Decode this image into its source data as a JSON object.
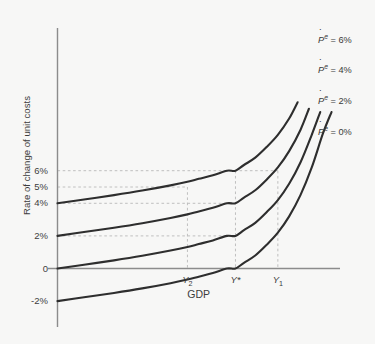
{
  "chart_data": {
    "type": "line",
    "title": "",
    "xlabel": "GDP",
    "ylabel": "Rate of change of unit costs",
    "grid": true,
    "legend_position": "right-of-curve-ends",
    "background_color": "#f7f7f6",
    "curve_color": "#2e2e2e",
    "axis_color": "#8c8c8c",
    "gridline_color": "#b9b9b9",
    "ylim": [
      -2,
      8
    ],
    "ytick_labels": [
      "6%",
      "5%",
      "4%",
      "2%",
      "0",
      "-2%"
    ],
    "ytick_values": [
      6,
      5,
      4,
      2,
      0,
      -2
    ],
    "xtick_labels": [
      "Y2",
      "Y*",
      "Y1"
    ],
    "xtick_display": [
      "Y",
      "Y*",
      "Y"
    ],
    "xtick_subscripts": [
      "2",
      "",
      "1"
    ],
    "xtick_values": [
      0.46,
      0.63,
      0.78
    ],
    "series": [
      {
        "name": "Pe = 6%",
        "label_p": "P",
        "label_sup": "e",
        "label_eq": " = 6%",
        "intercept": 4,
        "points": [
          [
            0.0,
            4.0
          ],
          [
            0.1,
            4.25
          ],
          [
            0.2,
            4.5
          ],
          [
            0.3,
            4.78
          ],
          [
            0.4,
            5.1
          ],
          [
            0.46,
            5.32
          ],
          [
            0.5,
            5.5
          ],
          [
            0.55,
            5.72
          ],
          [
            0.6,
            6.0
          ],
          [
            0.63,
            6.0
          ],
          [
            0.66,
            6.35
          ],
          [
            0.7,
            6.8
          ],
          [
            0.74,
            7.45
          ],
          [
            0.78,
            8.2
          ],
          [
            0.82,
            9.2
          ],
          [
            0.85,
            10.2
          ]
        ]
      },
      {
        "name": "Pe = 4%",
        "label_p": "P",
        "label_sup": "e",
        "label_eq": " = 4%",
        "intercept": 2,
        "points": [
          [
            0.0,
            2.0
          ],
          [
            0.1,
            2.25
          ],
          [
            0.2,
            2.5
          ],
          [
            0.3,
            2.78
          ],
          [
            0.4,
            3.1
          ],
          [
            0.46,
            3.32
          ],
          [
            0.5,
            3.5
          ],
          [
            0.55,
            3.72
          ],
          [
            0.6,
            4.0
          ],
          [
            0.63,
            4.0
          ],
          [
            0.66,
            4.35
          ],
          [
            0.7,
            4.8
          ],
          [
            0.74,
            5.45
          ],
          [
            0.78,
            6.2
          ],
          [
            0.82,
            7.2
          ],
          [
            0.86,
            8.5
          ],
          [
            0.89,
            9.8
          ]
        ]
      },
      {
        "name": "Pe = 2%",
        "label_p": "P",
        "label_sup": "e",
        "label_eq": " = 2%",
        "intercept": 0,
        "points": [
          [
            0.0,
            0.0
          ],
          [
            0.1,
            0.25
          ],
          [
            0.2,
            0.5
          ],
          [
            0.3,
            0.78
          ],
          [
            0.4,
            1.1
          ],
          [
            0.46,
            1.32
          ],
          [
            0.5,
            1.5
          ],
          [
            0.55,
            1.72
          ],
          [
            0.6,
            2.0
          ],
          [
            0.63,
            2.0
          ],
          [
            0.66,
            2.35
          ],
          [
            0.7,
            2.8
          ],
          [
            0.74,
            3.45
          ],
          [
            0.78,
            4.2
          ],
          [
            0.82,
            5.2
          ],
          [
            0.86,
            6.5
          ],
          [
            0.9,
            8.2
          ],
          [
            0.93,
            9.6
          ]
        ]
      },
      {
        "name": "Pe = 0%",
        "label_p": "P",
        "label_sup": "e",
        "label_eq": " = 0%",
        "intercept": -2,
        "points": [
          [
            0.0,
            -2.0
          ],
          [
            0.1,
            -1.75
          ],
          [
            0.2,
            -1.5
          ],
          [
            0.3,
            -1.22
          ],
          [
            0.4,
            -0.9
          ],
          [
            0.46,
            -0.68
          ],
          [
            0.5,
            -0.5
          ],
          [
            0.55,
            -0.28
          ],
          [
            0.6,
            0.0
          ],
          [
            0.63,
            0.0
          ],
          [
            0.66,
            0.35
          ],
          [
            0.7,
            0.8
          ],
          [
            0.74,
            1.45
          ],
          [
            0.78,
            2.2
          ],
          [
            0.82,
            3.2
          ],
          [
            0.86,
            4.5
          ],
          [
            0.9,
            6.2
          ],
          [
            0.94,
            8.3
          ],
          [
            0.97,
            9.6
          ]
        ]
      }
    ],
    "hgridlines": [
      6,
      5,
      4,
      2
    ],
    "vgridlines": [
      0.46,
      0.63,
      0.78
    ],
    "annotations": []
  }
}
